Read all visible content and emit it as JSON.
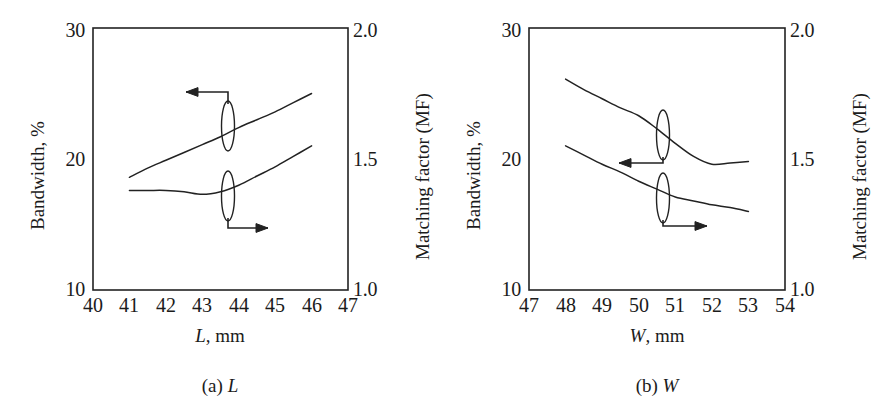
{
  "figure": {
    "background": "#ffffff",
    "line_color": "#222222",
    "text_color": "#1b1b1b"
  },
  "panels": [
    {
      "id": "a",
      "caption_prefix": "(a)",
      "caption_var": "L",
      "x_axis": {
        "label_var": "L",
        "label_unit": ", mm",
        "ticks": [
          "40",
          "41",
          "42",
          "43",
          "44",
          "45",
          "46",
          "47"
        ],
        "min": 40,
        "max": 47
      },
      "y_left": {
        "label": "Bandwidth, %",
        "ticks": [
          "30",
          "20",
          "10"
        ],
        "min": 10,
        "max": 30
      },
      "y_right": {
        "label": "Matching factor (MF)",
        "ticks": [
          "2.0",
          "1.5",
          "1.0"
        ],
        "min": 1.0,
        "max": 2.0
      },
      "annotations": [
        {
          "name": "bandwidth-left-arrow",
          "direction": "left"
        },
        {
          "name": "matching-factor-right-arrow",
          "direction": "right"
        }
      ]
    },
    {
      "id": "b",
      "caption_prefix": "(b)",
      "caption_var": "W",
      "x_axis": {
        "label_var": "W",
        "label_unit": ", mm",
        "ticks": [
          "47",
          "48",
          "49",
          "50",
          "51",
          "52",
          "53",
          "54"
        ],
        "min": 47,
        "max": 54
      },
      "y_left": {
        "label": "Bandwidth, %",
        "ticks": [
          "30",
          "20",
          "10"
        ],
        "min": 10,
        "max": 30
      },
      "y_right": {
        "label": "Matching factor (MF)",
        "ticks": [
          "2.0",
          "1.5",
          "1.0"
        ],
        "min": 1.0,
        "max": 2.0
      },
      "annotations": [
        {
          "name": "bandwidth-left-arrow",
          "direction": "left"
        },
        {
          "name": "matching-factor-right-arrow",
          "direction": "right"
        }
      ]
    }
  ],
  "chart_data": [
    {
      "type": "line",
      "title": "(a) L",
      "xlabel": "L, mm",
      "ylabel": "Bandwidth, %",
      "y2label": "Matching factor (MF)",
      "xlim": [
        40,
        47
      ],
      "ylim": [
        10,
        30
      ],
      "y2lim": [
        1.0,
        2.0
      ],
      "xticks": [
        40,
        41,
        42,
        43,
        44,
        45,
        46,
        47
      ],
      "yticks": [
        10,
        20,
        30
      ],
      "y2ticks": [
        1.0,
        1.5,
        2.0
      ],
      "grid": false,
      "legend": "arrow-annotations",
      "series": [
        {
          "name": "Bandwidth",
          "axis": "left",
          "annotation": "left-arrow",
          "x": [
            41.0,
            41.5,
            42.0,
            42.5,
            43.0,
            43.5,
            44.0,
            44.5,
            45.0,
            45.5,
            46.0
          ],
          "values": [
            18.6,
            19.3,
            19.9,
            20.5,
            21.1,
            21.7,
            22.4,
            23.0,
            23.6,
            24.3,
            25.0
          ]
        },
        {
          "name": "Matching factor (MF)",
          "axis": "right",
          "annotation": "right-arrow",
          "x": [
            41.0,
            41.5,
            42.0,
            42.5,
            43.0,
            43.5,
            44.0,
            44.5,
            45.0,
            45.5,
            46.0
          ],
          "values": [
            1.38,
            1.38,
            1.38,
            1.375,
            1.365,
            1.375,
            1.4,
            1.435,
            1.47,
            1.51,
            1.55
          ]
        }
      ]
    },
    {
      "type": "line",
      "title": "(b) W",
      "xlabel": "W, mm",
      "ylabel": "Bandwidth, %",
      "y2label": "Matching factor (MF)",
      "xlim": [
        47,
        54
      ],
      "ylim": [
        10,
        30
      ],
      "y2lim": [
        1.0,
        2.0
      ],
      "xticks": [
        47,
        48,
        49,
        50,
        51,
        52,
        53,
        54
      ],
      "yticks": [
        10,
        20,
        30
      ],
      "y2ticks": [
        1.0,
        1.5,
        2.0
      ],
      "grid": false,
      "legend": "arrow-annotations",
      "series": [
        {
          "name": "Bandwidth",
          "axis": "left",
          "annotation": "left-arrow",
          "x": [
            48.0,
            48.5,
            49.0,
            49.5,
            50.0,
            50.5,
            51.0,
            51.5,
            52.0,
            52.5,
            53.0
          ],
          "values": [
            26.1,
            25.3,
            24.6,
            23.9,
            23.3,
            22.3,
            21.2,
            20.2,
            19.6,
            19.7,
            19.8
          ]
        },
        {
          "name": "Matching factor (MF)",
          "axis": "right",
          "annotation": "right-arrow",
          "x": [
            48.0,
            48.5,
            49.0,
            49.5,
            50.0,
            50.5,
            51.0,
            51.5,
            52.0,
            52.5,
            53.0
          ],
          "values": [
            1.55,
            1.515,
            1.48,
            1.45,
            1.415,
            1.385,
            1.355,
            1.34,
            1.325,
            1.315,
            1.3
          ]
        }
      ]
    }
  ]
}
